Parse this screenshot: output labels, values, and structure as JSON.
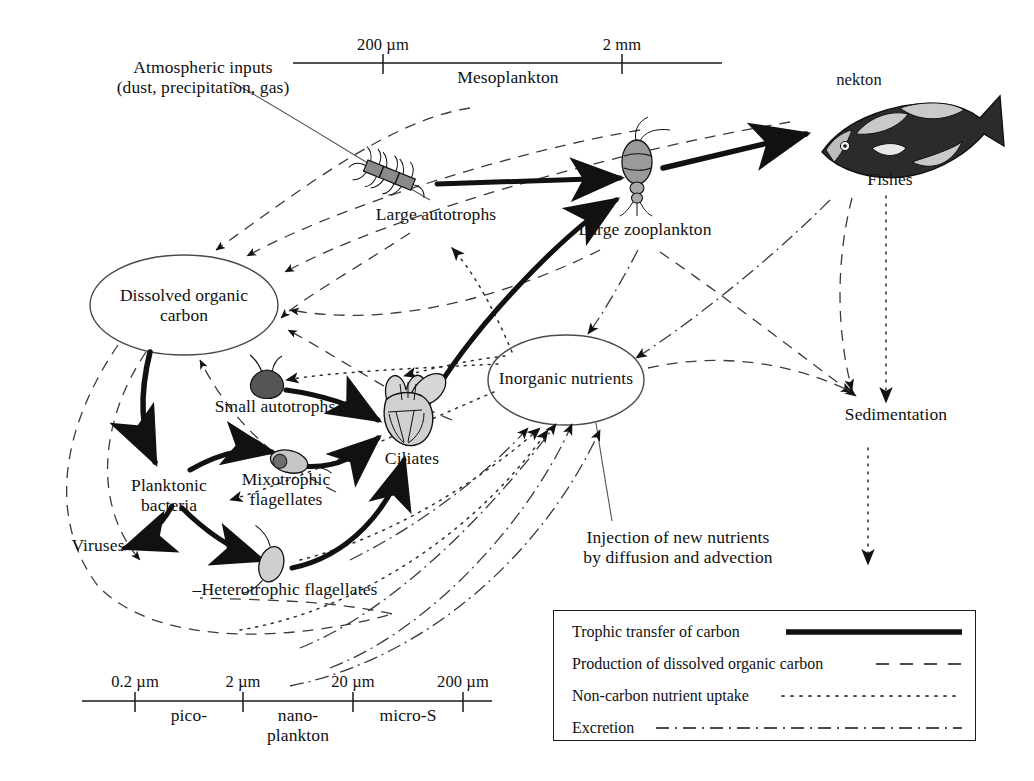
{
  "figure": {
    "background": "#ffffff",
    "ink": "#1a1a1a"
  },
  "scales": {
    "top": {
      "name": "Mesoplankton size scale",
      "band_label": "Mesoplankton",
      "ticks": [
        {
          "label": "200 µm",
          "x": 383
        },
        {
          "label": "2 mm",
          "x": 622
        }
      ],
      "line": {
        "x1": 293,
        "x2": 722,
        "y": 63
      }
    },
    "bottom": {
      "name": "Plankton size scale",
      "ticks": [
        {
          "label": "0.2 µm",
          "x": 135
        },
        {
          "label": "2 µm",
          "x": 243
        },
        {
          "label": "20 µm",
          "x": 353
        },
        {
          "label": "200 µm",
          "x": 463
        }
      ],
      "bands": [
        {
          "label": "pico-",
          "x": 189
        },
        {
          "label": "nano-",
          "x": 298
        },
        {
          "label": "plankton",
          "x": 298
        },
        {
          "label": "micro-S",
          "x": 408
        }
      ],
      "line": {
        "x1": 82,
        "x2": 492,
        "y": 701
      }
    }
  },
  "nodes": {
    "atmospheric_inputs": {
      "line1": "Atmospheric inputs",
      "line2": "(dust, precipitation, gas)",
      "x": 203,
      "y": 62
    },
    "dissolved_organic_carbon": {
      "line1": "Dissolved organic",
      "line2": "carbon",
      "x": 184,
      "y": 290
    },
    "inorganic_nutrients": {
      "label": "Inorganic nutrients",
      "x": 566,
      "y": 368
    },
    "large_autotrophs": {
      "label": "Large autotrophs",
      "x": 436,
      "y": 212
    },
    "large_zooplankton": {
      "label": "Large zooplankton",
      "x": 645,
      "y": 227
    },
    "nekton": {
      "label": "nekton",
      "x": 859,
      "y": 78
    },
    "fishes": {
      "label": "Fishes",
      "x": 890,
      "y": 177
    },
    "sedimentation": {
      "label": "Sedimentation",
      "x": 896,
      "y": 412
    },
    "small_autotrophs": {
      "label": "Small autotrophs",
      "x": 275,
      "y": 404
    },
    "mixotrophic_flagellates": {
      "line1": "Mixotrophic",
      "line2": "flagellates",
      "x": 286,
      "y": 477
    },
    "ciliates": {
      "label": "Ciliates",
      "x": 412,
      "y": 456
    },
    "planktonic_bacteria": {
      "line1": "Planktonic",
      "line2": "bacteria",
      "x": 169,
      "y": 483
    },
    "viruses": {
      "label": "Viruses",
      "x": 98,
      "y": 543
    },
    "heterotrophic_flagellates": {
      "label": "–Heterotrophic flagellates",
      "x": 285,
      "y": 587
    },
    "injection_of_new_nutrients": {
      "line1": "Injection of new nutrients",
      "line2": "by diffusion and advection",
      "x": 678,
      "y": 535
    }
  },
  "legend": {
    "name": "flow-type legend",
    "items": [
      {
        "label": "Trophic transfer of carbon",
        "style": "solid-thick"
      },
      {
        "label": "Production of dissolved organic carbon",
        "style": "dashed"
      },
      {
        "label": "Non-carbon nutrient uptake",
        "style": "dotted"
      },
      {
        "label": "Excretion",
        "style": "dash-dot"
      }
    ]
  }
}
